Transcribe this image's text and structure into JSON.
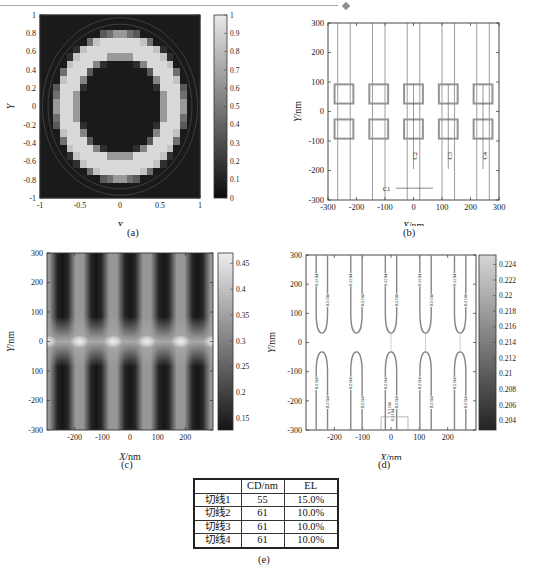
{
  "page": {
    "diamond_icon": "◆"
  },
  "captions": {
    "a": "(a)",
    "b": "(b)",
    "c": "(c)",
    "d": "(d)",
    "e": "(e)"
  },
  "chart_data": [
    {
      "id": "a",
      "type": "heatmap",
      "title": "",
      "xlabel": "X",
      "ylabel": "Y",
      "xlim": [
        -1,
        1
      ],
      "ylim": [
        -1,
        1
      ],
      "grid": false,
      "xtick_values": [
        -1,
        -0.5,
        0,
        0.5,
        1
      ],
      "xtick_labels": [
        "-1",
        "-0.5",
        "0",
        "0.5",
        "1"
      ],
      "ytick_values": [
        1,
        0.8,
        0.6,
        0.4,
        0.2,
        0,
        -0.2,
        -0.4,
        -0.6,
        -0.8,
        -1
      ],
      "ytick_labels": [
        "1",
        "0.8",
        "0.6",
        "0.4",
        "0.2",
        "0",
        "-0.2",
        "-0.4",
        "-0.6",
        "-0.8",
        "-1"
      ],
      "colorbar": {
        "min": 0,
        "max": 1,
        "tick_values": [
          1,
          0.9,
          0.8,
          0.7,
          0.6,
          0.5,
          0.4,
          0.3,
          0.2,
          0.1,
          0
        ],
        "tick_labels": [
          "1",
          "0.9",
          "0.8",
          "0.7",
          "0.6",
          "0.5",
          "0.4",
          "0.3",
          "0.2",
          "0.1",
          "0"
        ],
        "color_low": "#0b0b0b",
        "color_high": "#e9e9e9"
      },
      "ring": {
        "grid_n": 24,
        "inner_radius": 0.54,
        "outer_radius": 0.8,
        "ring_value": 0.85,
        "background_value": 0.1,
        "outline_circle_radii": [
          0.9,
          0.97
        ]
      }
    },
    {
      "id": "b",
      "type": "mask-layout",
      "title": "",
      "xlabel": "X/nm",
      "ylabel": "Y/nm",
      "xlim": [
        -300,
        300
      ],
      "ylim": [
        -300,
        300
      ],
      "grid": false,
      "xtick_values": [
        -300,
        -200,
        -100,
        0,
        100,
        200,
        300
      ],
      "xtick_labels": [
        "-300",
        "-200",
        "-100",
        "0",
        "100",
        "200",
        "300"
      ],
      "ytick_values": [
        300,
        200,
        100,
        0,
        -100,
        -200,
        -300
      ],
      "ytick_labels": [
        "300",
        "200",
        "100",
        "0",
        "-100",
        "-200",
        "-300"
      ],
      "stripe_centers_nm": [
        -244,
        -122,
        0,
        122,
        244
      ],
      "stripe_half_width_nm": 22,
      "square_half_width_nm": 33,
      "square_y_range_nm": [
        27,
        92
      ],
      "cutlines": {
        "vertical": [
          {
            "label": "C2",
            "x": 0
          },
          {
            "label": "C3",
            "x": 122
          },
          {
            "label": "C4",
            "x": 244
          }
        ],
        "vertical_y_range": [
          92,
          -195
        ],
        "vertical_label_y": -150,
        "horizontal": {
          "label": "C1",
          "y": -260,
          "x_range": [
            -62,
            68
          ],
          "label_x": -95
        }
      }
    },
    {
      "id": "c",
      "type": "heatmap",
      "title": "",
      "xlabel": "X/nm",
      "ylabel": "Y/nm",
      "xlim": [
        -300,
        300
      ],
      "ylim": [
        -300,
        300
      ],
      "grid": false,
      "xtick_values": [
        -200,
        -100,
        0,
        100,
        200
      ],
      "xtick_labels": [
        "-200",
        "-100",
        "0",
        "100",
        "200"
      ],
      "ytick_values": [
        300,
        200,
        100,
        0,
        -100,
        -200,
        -300
      ],
      "ytick_labels": [
        "300",
        "200",
        "100",
        "0",
        "100",
        "-200",
        "-300"
      ],
      "colorbar": {
        "min": 0.128,
        "max": 0.47,
        "tick_values": [
          0.45,
          0.4,
          0.35,
          0.3,
          0.25,
          0.2,
          0.15
        ],
        "tick_labels": [
          "0.45",
          "0.4",
          "0.35",
          "0.3",
          "0.25",
          "0.2",
          "0.15"
        ],
        "color_low": "#141414",
        "color_high": "#ededed"
      },
      "background_color": "#979797",
      "stripe_color": "#161616",
      "bright_color": "#f0f0f0",
      "stripe_centers_nm": [
        -244,
        -122,
        0,
        122,
        244
      ],
      "bright_spot_x_nm": [
        -300,
        -183,
        -61,
        61,
        183,
        300
      ]
    },
    {
      "id": "d",
      "type": "contour",
      "title": "",
      "xlabel": "X/nm",
      "ylabel": "Y/nm",
      "xlim": [
        -300,
        300
      ],
      "ylim": [
        -300,
        300
      ],
      "grid": false,
      "xtick_values": [
        -200,
        -100,
        0,
        100,
        200
      ],
      "xtick_labels": [
        "-200",
        "-100",
        "0",
        "100",
        "200"
      ],
      "ytick_values": [
        300,
        200,
        100,
        0,
        -100,
        -200,
        -300
      ],
      "ytick_labels": [
        "300",
        "200",
        "100",
        "0",
        "-100",
        "-200",
        "-300"
      ],
      "colorbar": {
        "min": 0.2028,
        "max": 0.2252,
        "tick_values": [
          0.224,
          0.222,
          0.22,
          0.218,
          0.216,
          0.214,
          0.212,
          0.21,
          0.208,
          0.206,
          0.204
        ],
        "tick_labels": [
          "0.224",
          "0.222",
          "0.22",
          "0.218",
          "0.216",
          "0.214",
          "0.212",
          "0.21",
          "0.208",
          "0.206",
          "0.204"
        ],
        "color_low": "#232323",
        "color_high": "#d6d6d6"
      },
      "contour_label": "0.2194",
      "stripe_centers_nm": [
        -244,
        -122,
        0,
        122,
        244
      ],
      "contour_half_gap_nm": 20,
      "u_bend_y_nm": 32,
      "cutline_x_nm": [
        0,
        122,
        244
      ],
      "bottom_rect": {
        "x_range": [
          -35,
          60
        ],
        "y_top": -255
      }
    }
  ],
  "table": {
    "headers": [
      "",
      "CD/nm",
      "EL"
    ],
    "rows": [
      [
        "切线1",
        "55",
        "15.0%"
      ],
      [
        "切线2",
        "61",
        "10.0%"
      ],
      [
        "切线3",
        "61",
        "10.0%"
      ],
      [
        "切线4",
        "61",
        "10.0%"
      ]
    ]
  }
}
